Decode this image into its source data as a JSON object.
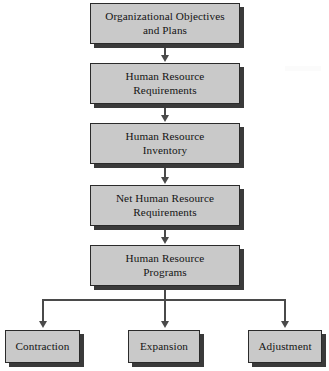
{
  "diagram": {
    "type": "flowchart",
    "colors": {
      "box_fill": "#c9c9c9",
      "box_border": "#2b2b2b",
      "box_shadow": "#3a3a3a",
      "connector": "#4a4a4a",
      "text": "#141414",
      "background": "#ffffff"
    },
    "main_steps": [
      {
        "id": "objectives",
        "label": "Organizational Objectives\nand Plans"
      },
      {
        "id": "requirements",
        "label": "Human Resource\nRequirements"
      },
      {
        "id": "inventory",
        "label": "Human Resource\nInventory"
      },
      {
        "id": "net_requirements",
        "label": "Net Human Resource\nRequirements"
      },
      {
        "id": "programs",
        "label": "Human Resource\nPrograms"
      }
    ],
    "outcomes": [
      {
        "id": "contraction",
        "label": "Contraction"
      },
      {
        "id": "expansion",
        "label": "Expansion"
      },
      {
        "id": "adjustment",
        "label": "Adjustment"
      }
    ],
    "connectors": {
      "main_chain_arrows": 4,
      "branch_arrows": 3,
      "branch_style": "orthogonal-split"
    }
  }
}
